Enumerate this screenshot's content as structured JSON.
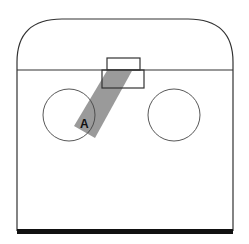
{
  "diagram": {
    "type": "court-layout",
    "colors": {
      "stroke": "#333333",
      "band": "#9a9a9a",
      "base_bar": "#111111",
      "background": "#ffffff"
    },
    "labels": {
      "position_a": "A"
    },
    "elements": [
      "rounded-top-outline",
      "horizontal-divider",
      "upper-small-box",
      "lower-box",
      "left-circle",
      "right-circle",
      "diagonal-gray-band",
      "base-bar"
    ]
  }
}
